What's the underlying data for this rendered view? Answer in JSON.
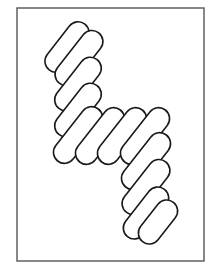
{
  "figure": {
    "colors": {
      "stroke": "#1a1a1a",
      "frame": "#555555",
      "background": "#ffffff"
    },
    "frame": {
      "x": 17,
      "y": 8,
      "width": 187,
      "height": 253
    },
    "pill_angle_deg": -52,
    "pill_width": 22,
    "pills": [
      {
        "cx": 67,
        "cy": 47,
        "len": 58
      },
      {
        "cx": 79,
        "cy": 58,
        "len": 64
      },
      {
        "cx": 78,
        "cy": 84,
        "len": 62
      },
      {
        "cx": 78,
        "cy": 110,
        "len": 62
      },
      {
        "cx": 78,
        "cy": 135,
        "len": 66
      },
      {
        "cx": 100,
        "cy": 136,
        "len": 66
      },
      {
        "cx": 122,
        "cy": 136,
        "len": 66
      },
      {
        "cx": 145,
        "cy": 136,
        "len": 66
      },
      {
        "cx": 146,
        "cy": 161,
        "len": 66
      },
      {
        "cx": 146,
        "cy": 187,
        "len": 64
      },
      {
        "cx": 146,
        "cy": 213,
        "len": 60
      },
      {
        "cx": 158,
        "cy": 222,
        "len": 50
      }
    ]
  }
}
